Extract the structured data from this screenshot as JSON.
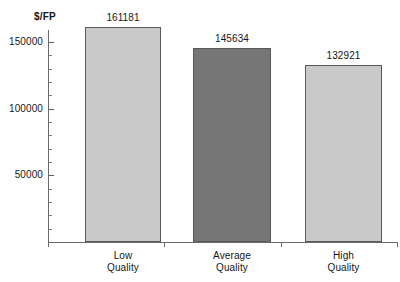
{
  "chart_data": {
    "type": "bar",
    "title": "",
    "subtitle": "",
    "xlabel": "",
    "ylabel": "$/FP",
    "categories": [
      "Low\nQuality",
      "Average\nQuality",
      "High\nQuality"
    ],
    "category_labels_flat": [
      "Low Quality",
      "Average Quality",
      "High Quality"
    ],
    "values": [
      161181,
      145634,
      132921
    ],
    "value_labels": [
      "161181",
      "145634",
      "132921"
    ],
    "ylim": [
      0,
      175000
    ],
    "ytick_labels": [
      "150000",
      "100000",
      "50000"
    ],
    "ytick_values": [
      150000,
      100000,
      50000
    ],
    "minor_tick_interval": 10000,
    "grid": false,
    "legend": null,
    "bar_colors": [
      "#c9c9c9",
      "#767676",
      "#c9c9c9"
    ],
    "bar_border_color": "#595959",
    "axis_color": "#6a6a6a"
  },
  "axis": {
    "y_title": "$/FP"
  }
}
